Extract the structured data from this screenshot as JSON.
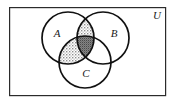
{
  "figure": {
    "type": "venn-diagram",
    "set_count": 3
  },
  "universe": {
    "label": "U",
    "label_x": 157,
    "label_y": 16,
    "rect": {
      "x": 9,
      "y": 7,
      "width": 157,
      "height": 89
    },
    "border_color": "#2b2b2b",
    "border_width": 1.2,
    "fill_color": "#ffffff"
  },
  "circles": [
    {
      "name": "A",
      "label": "A",
      "cx": 68,
      "cy": 38,
      "r": 26,
      "label_x": 57,
      "label_y": 34,
      "stroke_color": "#111111",
      "stroke_width": 1.7
    },
    {
      "name": "B",
      "label": "B",
      "cx": 103,
      "cy": 38,
      "r": 26,
      "label_x": 114,
      "label_y": 34,
      "stroke_color": "#111111",
      "stroke_width": 1.7
    },
    {
      "name": "C",
      "label": "C",
      "cx": 85,
      "cy": 62,
      "r": 26,
      "label_x": 86,
      "label_y": 74,
      "stroke_color": "#111111",
      "stroke_width": 1.7
    }
  ],
  "shaded_regions": [
    {
      "name": "A-and-B-not-C",
      "sets": [
        "A",
        "B"
      ],
      "excluded": [
        "C"
      ],
      "shade": "light",
      "fill_color": "#bdbdbd"
    },
    {
      "name": "A-and-C-not-B",
      "sets": [
        "A",
        "C"
      ],
      "excluded": [
        "B"
      ],
      "shade": "light",
      "fill_color": "#bdbdbd"
    },
    {
      "name": "A-and-B-and-C",
      "sets": [
        "A",
        "B",
        "C"
      ],
      "excluded": [],
      "shade": "dark",
      "fill_color": "#6e6e6e"
    }
  ],
  "unshaded_regions": [
    {
      "name": "A-only",
      "sets": [
        "A"
      ]
    },
    {
      "name": "B-only",
      "sets": [
        "B"
      ]
    },
    {
      "name": "C-only",
      "sets": [
        "C"
      ]
    },
    {
      "name": "B-and-C-not-A",
      "sets": [
        "B",
        "C"
      ]
    },
    {
      "name": "outside-all-circles",
      "sets": []
    }
  ],
  "colors": {
    "light_shade": "#bdbdbd",
    "dark_shade": "#6e6e6e",
    "circle_stroke": "#111111",
    "rect_stroke": "#2b2b2b",
    "background": "#ffffff",
    "text": "#1a1a1a"
  }
}
